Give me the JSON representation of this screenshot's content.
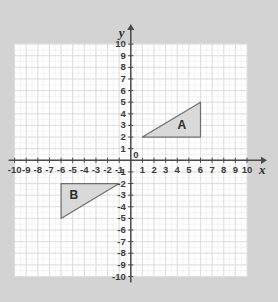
{
  "chart_data": {
    "type": "scatter",
    "title": "",
    "xlabel": "x",
    "ylabel": "y",
    "xlim": [
      -10,
      10
    ],
    "ylim": [
      -10,
      10
    ],
    "grid": true,
    "minor_grid": true,
    "minor_subdivisions": 2,
    "legend": "none",
    "origin_label": "0",
    "x_ticks": [
      "-10",
      "-9",
      "-8",
      "-7",
      "-6",
      "-5",
      "-4",
      "-3",
      "-2",
      "-1",
      "1",
      "2",
      "3",
      "4",
      "5",
      "6",
      "7",
      "8",
      "9",
      "10"
    ],
    "x_tick_values": [
      -10,
      -9,
      -8,
      -7,
      -6,
      -5,
      -4,
      -3,
      -2,
      -1,
      1,
      2,
      3,
      4,
      5,
      6,
      7,
      8,
      9,
      10
    ],
    "y_ticks_positive": [
      "10",
      "9",
      "8",
      "7",
      "6",
      "5",
      "4",
      "3",
      "2",
      "1"
    ],
    "y_tick_values_positive": [
      10,
      9,
      8,
      7,
      6,
      5,
      4,
      3,
      2,
      1
    ],
    "y_ticks_negative": [
      "-1",
      "-2",
      "-3",
      "-4",
      "-5",
      "-6",
      "-7",
      "-8",
      "-9",
      "-10"
    ],
    "y_tick_values_negative": [
      -1,
      -2,
      -3,
      -4,
      -5,
      -6,
      -7,
      -8,
      -9,
      -10
    ],
    "shapes": [
      {
        "name": "A",
        "label": "A",
        "type": "triangle",
        "vertices": [
          [
            1,
            2
          ],
          [
            6,
            2
          ],
          [
            6,
            5
          ]
        ],
        "label_position": [
          4.4,
          3
        ],
        "fill": "#d9d9d9",
        "stroke": "#6e6e6e"
      },
      {
        "name": "B",
        "label": "B",
        "type": "triangle",
        "vertices": [
          [
            -6,
            -2
          ],
          [
            -1,
            -2
          ],
          [
            -6,
            -5
          ]
        ],
        "label_position": [
          -4.9,
          -3
        ],
        "fill": "#d9d9d9",
        "stroke": "#6e6e6e"
      }
    ]
  },
  "colors": {
    "page_background": "#d3d3d3",
    "plot_background": "#ffffff",
    "major_grid": "#dcdcdc",
    "minor_grid": "#efefef",
    "axis": "#4a4a4a",
    "tick_text": "#3a3a3a",
    "shape_fill": "#d9d9d9",
    "shape_stroke": "#6e6e6e"
  }
}
